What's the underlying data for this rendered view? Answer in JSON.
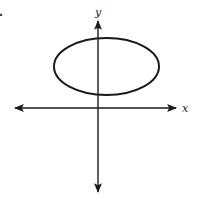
{
  "diagram": {
    "marker": ".",
    "axes": {
      "x_label": "x",
      "y_label": "y",
      "origin": [
        98,
        108
      ],
      "x_range_px": [
        14,
        177
      ],
      "y_range_px": [
        22,
        192
      ]
    },
    "ellipse": {
      "cx": 106.5,
      "cy": 66.5,
      "rx": 52.5,
      "ry": 28.5,
      "description": "horizontal ellipse located above the x-axis, centered slightly right of the y-axis"
    },
    "colors": {
      "stroke": "#1a1a1a",
      "background": "#ffffff"
    }
  }
}
